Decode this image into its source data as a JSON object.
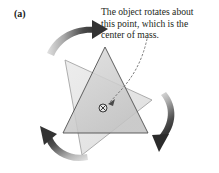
{
  "figure": {
    "panel_label": "(a)",
    "background_color": "#ffffff",
    "width": 219,
    "height": 173
  },
  "caption": {
    "lines": [
      "The object rotates about",
      "this point, which is the",
      "center of mass."
    ],
    "full_text": "The object rotates about this point, which is the center of mass.",
    "text_color": "#231f20"
  },
  "diagram": {
    "shapes": {
      "triangle_front": {
        "name": "upright-triangle",
        "points": "105,47 148,133 63,133",
        "fill": "#d2d2d2",
        "stroke": "#555555",
        "opacity": 0.85
      },
      "triangle_back": {
        "name": "rotated-triangle",
        "points": "65,60 152,100 82,155",
        "fill": "#e6e6e6",
        "stroke": "#9a9a9a",
        "opacity": 0.9
      }
    },
    "center_of_mass_marker": {
      "name": "center-of-mass-symbol",
      "x": 103,
      "y": 108,
      "radius": 4.0,
      "color": "#3a3a3a"
    },
    "leader_line": {
      "name": "dotted-leader-line",
      "path": "M 146,40 C 142,58 134,74 120,90 L 108,103",
      "color": "#6b6b6b",
      "dash": "1.6 2.4"
    },
    "arrows": [
      {
        "name": "rotation-arrow-top",
        "direction": "clockwise-top-right",
        "color_dark": "#3d3d3d",
        "color_light": "#d8d8d8"
      },
      {
        "name": "rotation-arrow-right",
        "direction": "clockwise-down-left",
        "color_dark": "#2f2f2f",
        "color_light": "#dcdcdc"
      },
      {
        "name": "rotation-arrow-bottom-left",
        "direction": "clockwise-up-left",
        "color_dark": "#3a3a3a",
        "color_light": "#dedede"
      }
    ]
  }
}
